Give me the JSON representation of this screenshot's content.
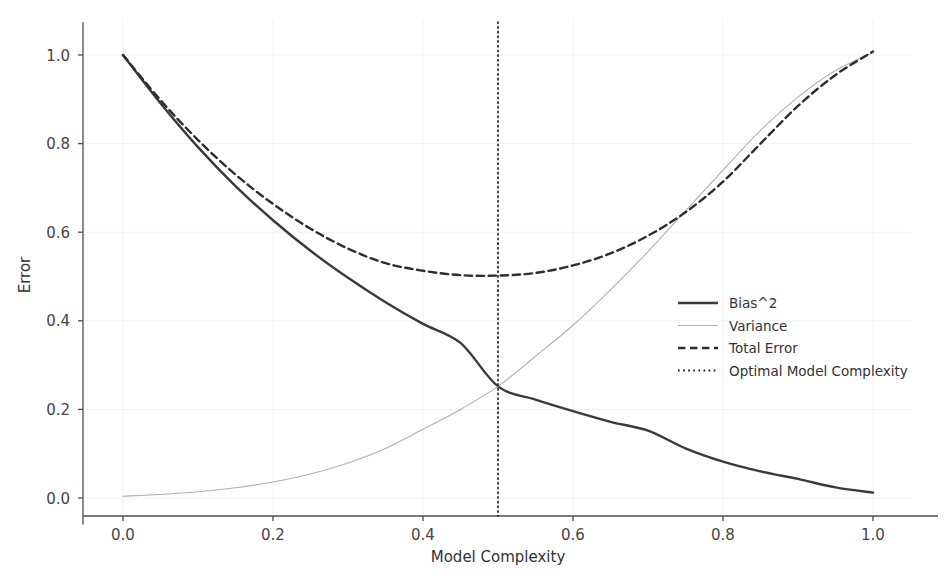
{
  "chart_data": {
    "type": "line",
    "title": "",
    "xlabel": "Model Complexity",
    "ylabel": "Error",
    "xlim": [
      -0.05,
      1.05
    ],
    "ylim": [
      -0.06,
      1.08
    ],
    "grid": true,
    "grid_color": "#f2f2f2",
    "legend_position": "center-right",
    "background": "#ffffff",
    "xticks": [
      0.0,
      0.2,
      0.4,
      0.6,
      0.8,
      1.0
    ],
    "xtick_labels": [
      "0.0",
      "0.2",
      "0.4",
      "0.6",
      "0.8",
      "1.0"
    ],
    "yticks": [
      0.0,
      0.2,
      0.4,
      0.6,
      0.8,
      1.0
    ],
    "ytick_labels": [
      "0.0",
      "0.2",
      "0.4",
      "0.6",
      "0.8",
      "1.0"
    ],
    "x": [
      0.0,
      0.05,
      0.1,
      0.15,
      0.2,
      0.25,
      0.3,
      0.35,
      0.4,
      0.45,
      0.5,
      0.55,
      0.6,
      0.65,
      0.7,
      0.75,
      0.8,
      0.85,
      0.9,
      0.95,
      1.0
    ],
    "series": [
      {
        "name": "Bias^2",
        "style": "solid",
        "color": "#3a3a3a",
        "width": 2.4,
        "values": [
          1.0,
          0.8123,
          0.6598,
          0.5359,
          0.4353,
          0.3535,
          0.2872,
          0.2333,
          0.1895,
          0.1539,
          0.125,
          0.1015,
          0.0825,
          0.067,
          0.0544,
          0.0442,
          0.0359,
          0.0292,
          0.0237,
          0.0192,
          0.0156
        ]
      },
      {
        "name": "Variance",
        "style": "solid",
        "color": "#b0b0b0",
        "width": 1.1,
        "values": [
          0.0,
          0.0026,
          0.0063,
          0.0117,
          0.0192,
          0.0295,
          0.0436,
          0.0627,
          0.0881,
          0.1219,
          0.1662,
          0.2242,
          0.2995,
          0.3968,
          0.5217,
          0.6808,
          0.8819,
          1.134,
          1.447,
          1.833,
          2.303
        ]
      },
      {
        "name": "Total Error",
        "style": "dashed",
        "color": "#2e2e2e",
        "width": 2.4,
        "values": [
          1.0,
          0.8149,
          0.6661,
          0.5476,
          0.4545,
          0.383,
          0.3308,
          0.296,
          0.2776,
          0.2758,
          0.2912,
          0.3257,
          0.382,
          0.4638,
          0.5761,
          0.725,
          0.9178,
          1.1632,
          1.4707,
          1.8522,
          2.3186
        ]
      }
    ],
    "display_curves": [
      {
        "name": "Bias^2",
        "style": "solid",
        "color": "#3a3a3a",
        "width": 2.4,
        "points": [
          [
            0.0,
            1.0
          ],
          [
            0.05,
            0.891
          ],
          [
            0.1,
            0.792
          ],
          [
            0.15,
            0.704
          ],
          [
            0.2,
            0.627
          ],
          [
            0.25,
            0.558
          ],
          [
            0.3,
            0.497
          ],
          [
            0.35,
            0.442
          ],
          [
            0.4,
            0.393
          ],
          [
            0.45,
            0.35
          ],
          [
            0.5,
            0.252
          ],
          [
            0.55,
            0.222
          ],
          [
            0.6,
            0.196
          ],
          [
            0.65,
            0.172
          ],
          [
            0.7,
            0.152
          ],
          [
            0.75,
            0.112
          ],
          [
            0.8,
            0.082
          ],
          [
            0.85,
            0.06
          ],
          [
            0.9,
            0.043
          ],
          [
            0.95,
            0.024
          ],
          [
            1.0,
            0.012
          ]
        ]
      },
      {
        "name": "Variance",
        "style": "solid",
        "color": "#b0b0b0",
        "width": 1.1,
        "points": [
          [
            0.0,
            0.004
          ],
          [
            0.05,
            0.008
          ],
          [
            0.1,
            0.014
          ],
          [
            0.15,
            0.023
          ],
          [
            0.2,
            0.036
          ],
          [
            0.25,
            0.054
          ],
          [
            0.3,
            0.079
          ],
          [
            0.35,
            0.112
          ],
          [
            0.4,
            0.155
          ],
          [
            0.45,
            0.2
          ],
          [
            0.5,
            0.252
          ],
          [
            0.55,
            0.32
          ],
          [
            0.6,
            0.39
          ],
          [
            0.65,
            0.47
          ],
          [
            0.7,
            0.556
          ],
          [
            0.75,
            0.648
          ],
          [
            0.8,
            0.74
          ],
          [
            0.85,
            0.83
          ],
          [
            0.9,
            0.905
          ],
          [
            0.95,
            0.965
          ],
          [
            1.0,
            1.005
          ]
        ]
      },
      {
        "name": "Total Error",
        "style": "dashed",
        "color": "#2e2e2e",
        "width": 2.4,
        "points": [
          [
            0.0,
            1.0
          ],
          [
            0.05,
            0.898
          ],
          [
            0.1,
            0.808
          ],
          [
            0.15,
            0.73
          ],
          [
            0.2,
            0.664
          ],
          [
            0.25,
            0.608
          ],
          [
            0.3,
            0.563
          ],
          [
            0.35,
            0.53
          ],
          [
            0.4,
            0.513
          ],
          [
            0.45,
            0.503
          ],
          [
            0.5,
            0.502
          ],
          [
            0.55,
            0.508
          ],
          [
            0.6,
            0.525
          ],
          [
            0.65,
            0.552
          ],
          [
            0.7,
            0.592
          ],
          [
            0.75,
            0.645
          ],
          [
            0.8,
            0.714
          ],
          [
            0.85,
            0.8
          ],
          [
            0.9,
            0.885
          ],
          [
            0.95,
            0.955
          ],
          [
            1.0,
            1.008
          ]
        ]
      }
    ],
    "vline": {
      "name": "Optimal Model Complexity",
      "x": 0.5,
      "style": "dotted",
      "color": "#1a1a1a",
      "width": 1.6
    },
    "annotations": []
  },
  "legend": {
    "entries": [
      {
        "label": "Bias^2",
        "style": "solid",
        "color": "#3a3a3a",
        "width": 2.6
      },
      {
        "label": "Variance",
        "style": "solid",
        "color": "#b0b0b0",
        "width": 1.1
      },
      {
        "label": "Total Error",
        "style": "dashed",
        "color": "#2e2e2e",
        "width": 2.4
      },
      {
        "label": "Optimal Model Complexity",
        "style": "dotted",
        "color": "#1a1a1a",
        "width": 1.8
      }
    ]
  },
  "axes": {
    "x_title": "Model Complexity",
    "y_title": "Error",
    "spine_color": "#4d4d4d"
  }
}
